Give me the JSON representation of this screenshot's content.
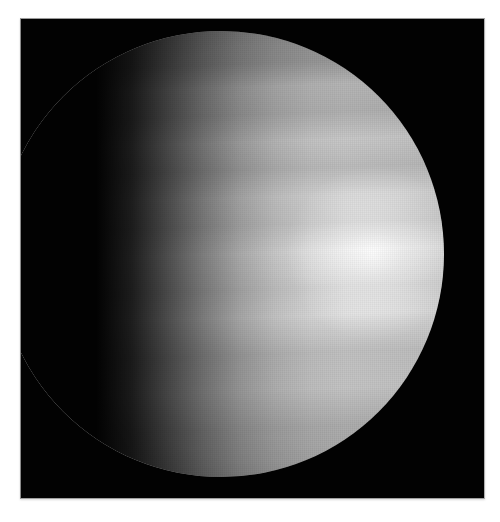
{
  "image": {
    "subject": "Venus",
    "description": "Gibbous view of a cloud-covered planet with a bright sunlit region on the right limb and a dark terminator on the left, on a black background",
    "colors": {
      "background": "#ffffff",
      "frame": "#020202",
      "planet_bright": "#f5f5f5",
      "planet_mid": "#b3b3b3",
      "planet_dark": "#5a5a5a"
    }
  }
}
